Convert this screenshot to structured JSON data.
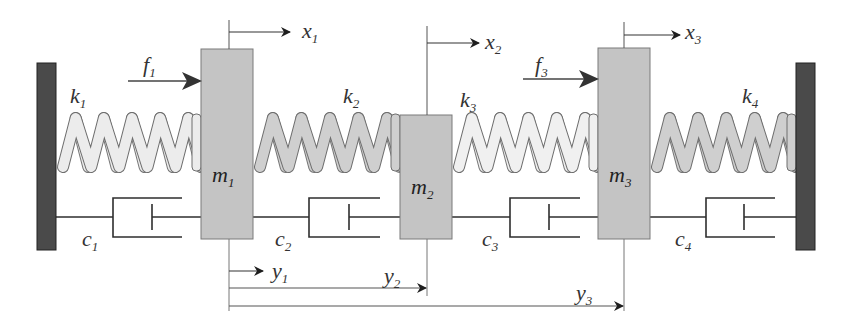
{
  "diagram": {
    "colors": {
      "wall": "#4a4a4a",
      "mass": "#c4c4c4",
      "spring_light": "#ececec",
      "spring_medium": "#cfcfcf",
      "line": "#333333",
      "arrow": "#222222"
    },
    "walls": [
      {
        "id": "left-wall",
        "x": 37,
        "y": 63,
        "w": 19,
        "h": 187
      },
      {
        "id": "right-wall",
        "x": 796,
        "y": 63,
        "w": 19,
        "h": 187
      }
    ],
    "masses": [
      {
        "id": "m1",
        "base": "m",
        "sub": "1",
        "x": 201,
        "y": 49,
        "w": 52,
        "h": 190
      },
      {
        "id": "m2",
        "base": "m",
        "sub": "2",
        "x": 400,
        "y": 115,
        "w": 52,
        "h": 124
      },
      {
        "id": "m3",
        "base": "m",
        "sub": "3",
        "x": 598,
        "y": 48,
        "w": 52,
        "h": 191
      }
    ],
    "springs": [
      {
        "id": "k1",
        "base": "k",
        "sub": "1",
        "x1": 56,
        "x2": 201,
        "label_x": 70,
        "label_y": 103,
        "fill": "#ececec"
      },
      {
        "id": "k2",
        "base": "k",
        "sub": "2",
        "x1": 253,
        "x2": 400,
        "label_x": 343,
        "label_y": 103,
        "fill": "#cfcfcf"
      },
      {
        "id": "k3",
        "base": "k",
        "sub": "3",
        "x1": 452,
        "x2": 598,
        "label_x": 460,
        "label_y": 107,
        "fill": "#f0f0f0"
      },
      {
        "id": "k4",
        "base": "k",
        "sub": "4",
        "x1": 650,
        "x2": 796,
        "label_x": 742,
        "label_y": 103,
        "fill": "#cfcfcf"
      }
    ],
    "dampers": [
      {
        "id": "c1",
        "base": "c",
        "sub": "1",
        "label_x": 82,
        "label_y": 246
      },
      {
        "id": "c2",
        "base": "c",
        "sub": "2",
        "label_x": 275,
        "label_y": 246
      },
      {
        "id": "c3",
        "base": "c",
        "sub": "3",
        "label_x": 482,
        "label_y": 246
      },
      {
        "id": "c4",
        "base": "c",
        "sub": "4",
        "label_x": 675,
        "label_y": 246
      }
    ],
    "forces": [
      {
        "id": "f1",
        "base": "f",
        "sub": "1",
        "label_x": 143,
        "label_y": 72
      },
      {
        "id": "f3",
        "base": "f",
        "sub": "3",
        "label_x": 535,
        "label_y": 72
      }
    ],
    "displacements_x": [
      {
        "id": "x1",
        "base": "x",
        "sub": "1",
        "label_x": 302,
        "label_y": 38
      },
      {
        "id": "x2",
        "base": "x",
        "sub": "2",
        "label_x": 485,
        "label_y": 49
      },
      {
        "id": "x3",
        "base": "x",
        "sub": "3",
        "label_x": 685,
        "label_y": 39
      }
    ],
    "displacements_y": [
      {
        "id": "y1",
        "base": "y",
        "sub": "1",
        "label_x": 272,
        "label_y": 278
      },
      {
        "id": "y2",
        "base": "y",
        "sub": "2",
        "label_x": 384,
        "label_y": 283
      },
      {
        "id": "y3",
        "base": "y",
        "sub": "3",
        "label_x": 576,
        "label_y": 300
      }
    ]
  }
}
